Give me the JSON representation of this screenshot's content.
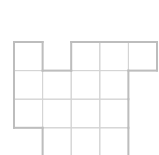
{
  "diagram": {
    "type": "grid-net",
    "cell_size": 28.6,
    "origin": [
      14,
      42
    ],
    "cells": [
      [
        0,
        0
      ],
      [
        2,
        0
      ],
      [
        3,
        0
      ],
      [
        4,
        0
      ],
      [
        0,
        1
      ],
      [
        1,
        1
      ],
      [
        2,
        1
      ],
      [
        3,
        1
      ],
      [
        0,
        2
      ],
      [
        1,
        2
      ],
      [
        2,
        2
      ],
      [
        3,
        2
      ],
      [
        1,
        3
      ],
      [
        2,
        3
      ],
      [
        3,
        3
      ]
    ],
    "colors": {
      "inner_line": "#d4d4d4",
      "outer_line": "#bdbdbd",
      "background": "#ffffff"
    }
  }
}
